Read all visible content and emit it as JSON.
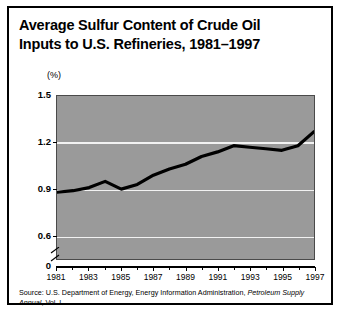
{
  "title": {
    "line1": "Average Sulfur Content of Crude Oil",
    "line2": "Inputs to U.S. Refineries, 1981–1997"
  },
  "source": {
    "prefix": "Source: U.S. Department of Energy, Energy Information Administration, ",
    "publication": "Petroleum Supply Annual",
    "suffix": ", Vol. I."
  },
  "colors": {
    "plot_background": "#9a9a9a",
    "gridline": "#f2f2f2",
    "line": "#000000",
    "frame": "#000000",
    "page_background": "#ffffff"
  },
  "chart_data": {
    "type": "line",
    "title": "Average Sulfur Content of Crude Oil Inputs to U.S. Refineries, 1981–1997",
    "xlabel": "",
    "ylabel": "(%)",
    "unit": "(%)",
    "grid": true,
    "legend": false,
    "axis_break": true,
    "ylim": [
      0.45,
      1.5
    ],
    "yticks": [
      0.6,
      0.9,
      1.2,
      1.5
    ],
    "ytick_labels": [
      "0.6",
      "0.9",
      "1.2",
      "1.5"
    ],
    "y_zero_label": "0",
    "xlim": [
      1981,
      1997
    ],
    "xticks": [
      1981,
      1983,
      1985,
      1987,
      1989,
      1991,
      1993,
      1995,
      1997
    ],
    "xtick_labels": [
      "1981",
      "1983",
      "1985",
      "1987",
      "1989",
      "1991",
      "1993",
      "1995",
      "1997"
    ],
    "x_minor_ticks": [
      1982,
      1984,
      1986,
      1988,
      1990,
      1992,
      1994,
      1996
    ],
    "x": [
      1981,
      1982,
      1983,
      1984,
      1985,
      1986,
      1987,
      1988,
      1989,
      1990,
      1991,
      1992,
      1993,
      1994,
      1995,
      1996,
      1997
    ],
    "values": [
      0.88,
      0.89,
      0.91,
      0.95,
      0.9,
      0.93,
      0.99,
      1.03,
      1.06,
      1.11,
      1.14,
      1.18,
      1.17,
      1.16,
      1.15,
      1.18,
      1.27
    ],
    "series": [
      {
        "name": "Average sulfur content",
        "values": [
          0.88,
          0.89,
          0.91,
          0.95,
          0.9,
          0.93,
          0.99,
          1.03,
          1.06,
          1.11,
          1.14,
          1.18,
          1.17,
          1.16,
          1.15,
          1.18,
          1.27
        ]
      }
    ]
  }
}
